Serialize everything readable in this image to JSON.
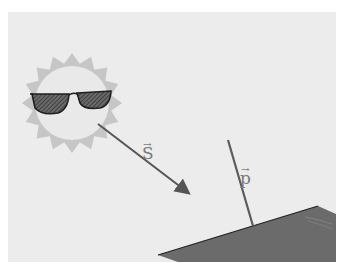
{
  "diagram": {
    "background_color": "#ffffff",
    "panel_color": "#ececec",
    "sun": {
      "center": [
        72,
        103
      ],
      "body_radius": 37,
      "ray_radius": 50,
      "ray_count": 16,
      "body_color": "#e9e9e9",
      "ray_color": "#c6c6c6",
      "accessory": "sunglasses"
    },
    "vectors": [
      {
        "id": "S",
        "label": "S",
        "arrow_symbol": "→",
        "from": [
          98,
          124
        ],
        "to": [
          192,
          196
        ],
        "color": "#555555",
        "has_arrowhead": true
      },
      {
        "id": "p",
        "label": "p",
        "arrow_symbol": "→",
        "from": [
          228,
          140
        ],
        "to": [
          253,
          226
        ],
        "color": "#5c5c5c",
        "has_arrowhead": false
      }
    ],
    "surface": {
      "color": "#6b6b6b",
      "edge_color": "#222222",
      "points": [
        [
          158,
          255
        ],
        [
          318,
          206
        ],
        [
          336,
          214
        ],
        [
          336,
          262
        ],
        [
          178,
          262
        ]
      ]
    }
  }
}
